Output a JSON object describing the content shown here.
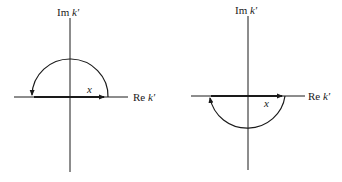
{
  "diagrams": [
    {
      "name": "upper-contour",
      "im_axis_label": "Im",
      "re_axis_label": "Re",
      "variable": "k'",
      "segment_label": "x",
      "arc": "upper semicircle",
      "direction": "counterclockwise"
    },
    {
      "name": "lower-contour",
      "im_axis_label": "Im",
      "re_axis_label": "Re",
      "variable": "k'",
      "segment_label": "x",
      "arc": "lower semicircle",
      "direction": "clockwise"
    }
  ],
  "colors": {
    "ink": "#1a1a1a",
    "background": "#ffffff"
  }
}
